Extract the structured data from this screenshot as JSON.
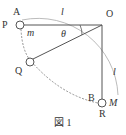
{
  "figure": {
    "caption": "図 1",
    "labels": {
      "P": "P",
      "A": "A",
      "O": "O",
      "Q": "Q",
      "B": "B",
      "R": "R",
      "m": "m",
      "M": "M",
      "theta": "θ",
      "l_top": "l",
      "l_right": "l"
    },
    "colors": {
      "line": "#555555",
      "arc": "#999999",
      "text": "#333333"
    }
  }
}
